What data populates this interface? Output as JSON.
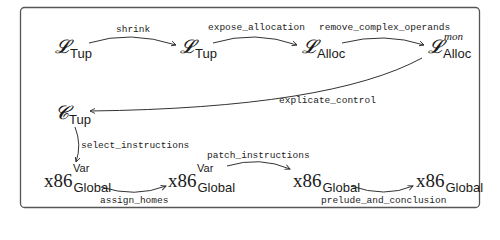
{
  "diagram": {
    "nodes": {
      "ltup1": {
        "base": "𝓛",
        "sub": "Tup"
      },
      "ltup2": {
        "base": "𝓛",
        "sub": "Tup"
      },
      "lalloc": {
        "base": "𝓛",
        "sub": "Alloc"
      },
      "lalloc_mon": {
        "base": "𝓛",
        "sub": "Alloc",
        "sup": "mon"
      },
      "ctup": {
        "base": "𝓒",
        "sub": "Tup"
      },
      "x86var1": {
        "base": "x86",
        "sub": "Global",
        "sup": "Var"
      },
      "x86var2": {
        "base": "x86",
        "sub": "Global",
        "sup": "Var"
      },
      "x86global1": {
        "base": "x86",
        "sub": "Global"
      },
      "x86global2": {
        "base": "x86",
        "sub": "Global"
      }
    },
    "edges": {
      "shrink": "shrink",
      "expose_allocation": "expose_allocation",
      "remove_complex_operands": "remove_complex_operands",
      "explicate_control": "explicate_control",
      "select_instructions": "select_instructions",
      "assign_homes": "assign_homes",
      "patch_instructions": "patch_instructions",
      "prelude_and_conclusion": "prelude_and_conclusion"
    }
  }
}
